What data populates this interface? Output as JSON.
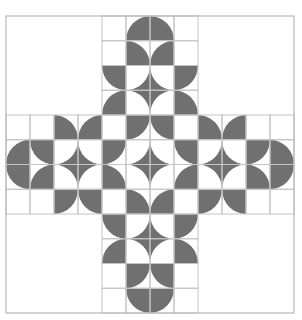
{
  "figure": {
    "title": "Quarter-circle quilt cross pattern",
    "grid": {
      "cols": 12,
      "rows": 12,
      "x0": 6,
      "y0": 16,
      "cell_w": 24,
      "cell_h": 24.75
    },
    "colors": {
      "fill": "#707070",
      "grid_line": "#c4c4c4",
      "border": "#b8b8b8",
      "background": "#ffffff"
    },
    "legend": "Q = filled quarter disc centred at corner; S = square minus quarter disc at corner; W = white",
    "blank_corners": [
      {
        "col": 0,
        "row": 0,
        "size": 4
      },
      {
        "col": 8,
        "row": 0,
        "size": 4
      },
      {
        "col": 0,
        "row": 8,
        "size": 4
      },
      {
        "col": 8,
        "row": 8,
        "size": 4
      }
    ],
    "cells": [
      [
        "",
        "",
        "",
        "",
        "W",
        "Q-br",
        "Q-bl",
        "W",
        "",
        "",
        "",
        ""
      ],
      [
        "",
        "",
        "",
        "",
        "W",
        "Q-bl",
        "Q-br",
        "W",
        "",
        "",
        "",
        ""
      ],
      [
        "",
        "",
        "",
        "",
        "Q-tr",
        "S-tl",
        "S-tr",
        "Q-tl",
        "",
        "",
        "",
        ""
      ],
      [
        "",
        "",
        "",
        "",
        "Q-br",
        "S-bl",
        "S-br",
        "Q-bl",
        "",
        "",
        "",
        ""
      ],
      [
        "W",
        "W",
        "Q-bl",
        "Q-br",
        "W",
        "Q-tl",
        "Q-tr",
        "W",
        "Q-bl",
        "Q-br",
        "W",
        "W"
      ],
      [
        "Q-br",
        "Q-tr",
        "S-tl",
        "S-tr",
        "Q-tl",
        "S-tl",
        "S-tr",
        "Q-tr",
        "S-tl",
        "S-tr",
        "Q-tl",
        "Q-bl"
      ],
      [
        "Q-tr",
        "Q-br",
        "S-bl",
        "S-br",
        "Q-bl",
        "S-bl",
        "S-br",
        "Q-br",
        "S-bl",
        "S-br",
        "Q-bl",
        "Q-tl"
      ],
      [
        "W",
        "W",
        "Q-tl",
        "Q-tr",
        "W",
        "Q-bl",
        "Q-br",
        "W",
        "Q-tl",
        "Q-tr",
        "W",
        "W"
      ],
      [
        "",
        "",
        "",
        "",
        "Q-tr",
        "S-tl",
        "S-tr",
        "Q-tl",
        "",
        "",
        "",
        ""
      ],
      [
        "",
        "",
        "",
        "",
        "Q-br",
        "S-bl",
        "S-br",
        "Q-bl",
        "",
        "",
        "",
        ""
      ],
      [
        "",
        "",
        "",
        "",
        "W",
        "Q-tl",
        "Q-tr",
        "W",
        "",
        "",
        "",
        ""
      ],
      [
        "",
        "",
        "",
        "",
        "W",
        "Q-tr",
        "Q-tl",
        "W",
        "",
        "",
        "",
        ""
      ]
    ]
  }
}
